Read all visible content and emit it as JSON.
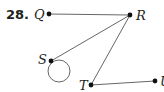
{
  "problem_number": "28.",
  "vertices": [
    {
      "id": "Q",
      "label": "Q",
      "x": 49,
      "y": 14,
      "lx": 34,
      "ly": 19
    },
    {
      "id": "R",
      "label": "R",
      "x": 130,
      "y": 15,
      "lx": 136,
      "ly": 20
    },
    {
      "id": "S",
      "label": "S",
      "x": 51,
      "y": 61,
      "lx": 38,
      "ly": 64
    },
    {
      "id": "T",
      "label": "T",
      "x": 91,
      "y": 85,
      "lx": 79,
      "ly": 90
    },
    {
      "id": "U",
      "label": "U",
      "x": 155,
      "y": 81,
      "lx": 160,
      "ly": 86
    }
  ],
  "edges": [
    {
      "from": "Q",
      "to": "R"
    },
    {
      "from": "R",
      "to": "S"
    },
    {
      "from": "R",
      "to": "T"
    },
    {
      "from": "T",
      "to": "U"
    }
  ],
  "loops": [
    {
      "vertex": "S",
      "cx": 59,
      "cy": 71,
      "r": 11
    }
  ],
  "colors": {
    "edge": "#555555",
    "vertex": "#111111",
    "text": "#231f20"
  }
}
